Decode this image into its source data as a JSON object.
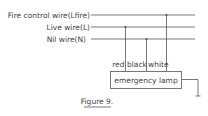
{
  "diagram": {
    "wires": [
      {
        "label": "Fire control wire(Lfire)"
      },
      {
        "label": "Live wire(L)"
      },
      {
        "label": "Nil wire(N)"
      }
    ],
    "connectors": [
      {
        "label": "red"
      },
      {
        "label": "black"
      },
      {
        "label": "white"
      }
    ],
    "device": {
      "label": "emergency lamp"
    },
    "caption": "Figure 9.",
    "colors": {
      "line": "#555555",
      "text": "#444444",
      "background": "#ffffff"
    }
  }
}
